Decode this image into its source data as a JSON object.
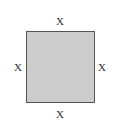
{
  "figure": {
    "shape": "square",
    "fill_color": "#cccccc",
    "border_color": "#555555",
    "labels": {
      "top": "X",
      "bottom": "X",
      "left": "X",
      "right": "X"
    }
  }
}
